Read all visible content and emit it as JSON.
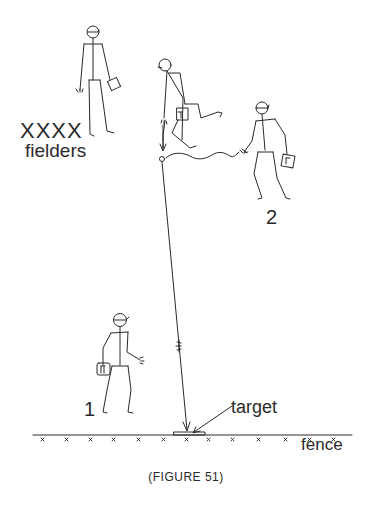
{
  "figure": {
    "caption": "(FIGURE 51)",
    "labels": {
      "fielders_marks": "XXXX",
      "fielders": "fielders",
      "player_2": "2",
      "player_1": "1",
      "target": "target",
      "fence": "fence"
    },
    "elements": {
      "players": [
        "fielder-standing",
        "fielder-running-with-ball",
        "player-2-throwing",
        "player-1-receiving"
      ],
      "ball": "ball-circle",
      "throw_path": "ball-trajectory-to-target",
      "fence_line": "fence-with-x-marks",
      "target_box": "target-on-fence"
    },
    "colors": {
      "ink": "#2a2a2a",
      "background": "#ffffff"
    }
  }
}
